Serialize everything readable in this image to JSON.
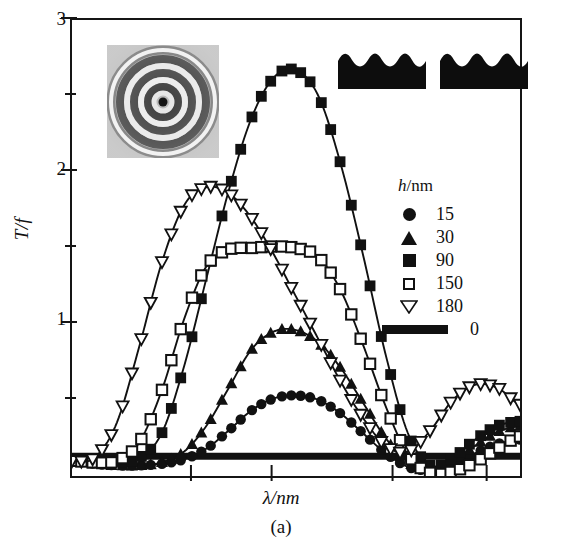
{
  "figure": {
    "caption": "(a)",
    "xlabel": "λ/nm",
    "ylabel": "T/f"
  },
  "axes": {
    "y_ticks_major": [
      "1",
      "2",
      "3"
    ],
    "y_major_values": [
      1,
      2,
      3
    ],
    "y_minor_values": [
      0.5,
      1.5,
      2.5
    ],
    "ylim": [
      0,
      3
    ],
    "xlim": [
      0,
      1
    ],
    "x_tick_positions": [
      0.27,
      0.45,
      0.72,
      0.93
    ],
    "x_tick_labels": [
      "",
      "",
      "",
      ""
    ]
  },
  "legend": {
    "title_italic": "h",
    "title_rest": "/nm",
    "position": "right-middle",
    "entries": [
      {
        "label": "15",
        "marker": "filled-circle"
      },
      {
        "label": "30",
        "marker": "filled-triangle-up"
      },
      {
        "label": "90",
        "marker": "filled-square"
      },
      {
        "label": "150",
        "marker": "open-square"
      },
      {
        "label": "180",
        "marker": "open-triangle-down"
      },
      {
        "label": "0",
        "marker": "thick-line"
      }
    ]
  },
  "insets": {
    "rings": {
      "name": "concentric-rings-interferogram"
    },
    "gratings": [
      {
        "name": "corrugated-grating-profile-left"
      },
      {
        "name": "corrugated-grating-profile-right"
      }
    ]
  },
  "chart_data": {
    "type": "line",
    "title": "",
    "xlabel": "λ/nm",
    "ylabel": "T/f",
    "xlim": [
      0,
      1
    ],
    "ylim": [
      0,
      3
    ],
    "grid": false,
    "legend_position": "right-middle",
    "legend_title": "h/nm",
    "x": [
      0.0,
      0.05,
      0.1,
      0.15,
      0.2,
      0.25,
      0.3,
      0.35,
      0.4,
      0.45,
      0.5,
      0.55,
      0.6,
      0.65,
      0.7,
      0.75,
      0.8,
      0.85,
      0.9,
      0.95,
      1.0
    ],
    "series": [
      {
        "name": "0",
        "h_nm": 0,
        "marker": "thick-line",
        "values": [
          0.13,
          0.13,
          0.13,
          0.13,
          0.13,
          0.13,
          0.13,
          0.13,
          0.13,
          0.13,
          0.13,
          0.13,
          0.13,
          0.13,
          0.13,
          0.13,
          0.13,
          0.13,
          0.13,
          0.13,
          0.13
        ]
      },
      {
        "name": "15",
        "h_nm": 15,
        "marker": "filled-circle",
        "values": [
          0.1,
          0.08,
          0.07,
          0.07,
          0.08,
          0.11,
          0.18,
          0.3,
          0.43,
          0.51,
          0.53,
          0.5,
          0.41,
          0.28,
          0.15,
          0.06,
          0.04,
          0.08,
          0.15,
          0.21,
          0.24
        ]
      },
      {
        "name": "30",
        "h_nm": 30,
        "marker": "filled-triangle-up",
        "values": [
          0.1,
          0.08,
          0.07,
          0.07,
          0.09,
          0.16,
          0.33,
          0.58,
          0.83,
          0.95,
          0.96,
          0.88,
          0.71,
          0.48,
          0.25,
          0.09,
          0.05,
          0.1,
          0.2,
          0.29,
          0.33
        ]
      },
      {
        "name": "90",
        "h_nm": 90,
        "marker": "filled-square",
        "values": [
          0.1,
          0.09,
          0.09,
          0.12,
          0.28,
          0.72,
          1.3,
          1.88,
          2.35,
          2.62,
          2.67,
          2.5,
          2.05,
          1.45,
          0.8,
          0.28,
          0.07,
          0.12,
          0.24,
          0.33,
          0.36
        ]
      },
      {
        "name": "150",
        "h_nm": 150,
        "marker": "open-square",
        "values": [
          0.1,
          0.09,
          0.1,
          0.22,
          0.56,
          1.03,
          1.38,
          1.49,
          1.5,
          1.51,
          1.5,
          1.44,
          1.22,
          0.86,
          0.46,
          0.14,
          0.02,
          0.03,
          0.09,
          0.18,
          0.26
        ]
      },
      {
        "name": "180",
        "h_nm": 180,
        "marker": "open-triangle-down",
        "values": [
          0.1,
          0.12,
          0.35,
          0.85,
          1.4,
          1.78,
          1.9,
          1.86,
          1.7,
          1.46,
          1.18,
          0.9,
          0.62,
          0.38,
          0.2,
          0.16,
          0.3,
          0.5,
          0.6,
          0.58,
          0.47
        ]
      }
    ]
  }
}
